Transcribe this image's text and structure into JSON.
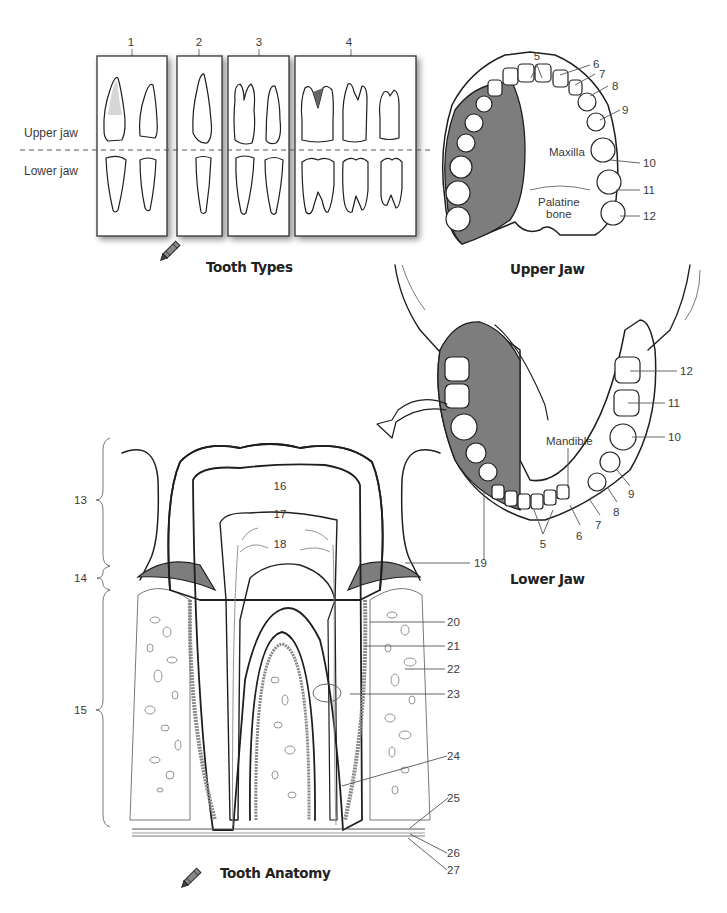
{
  "header": {
    "running_head": "Tooth Anatomy"
  },
  "tooth_types": {
    "title": "Tooth Types",
    "row_labels": {
      "upper": "Upper jaw",
      "lower": "Lower jaw"
    },
    "group_numbers": [
      "1",
      "2",
      "3",
      "4"
    ],
    "icon": "crayon-icon"
  },
  "upper_jaw": {
    "title": "Upper Jaw",
    "region_labels": {
      "maxilla": "Maxilla",
      "palatine_line1": "Palatine",
      "palatine_line2": "bone"
    },
    "callouts": [
      "5",
      "6",
      "7",
      "8",
      "9",
      "10",
      "11",
      "12"
    ]
  },
  "lower_jaw": {
    "title": "Lower Jaw",
    "region_labels": {
      "mandible": "Mandible"
    },
    "callouts": [
      "12",
      "11",
      "10",
      "9",
      "8",
      "7",
      "6",
      "5",
      "19"
    ]
  },
  "tooth_anatomy": {
    "title": "Tooth Anatomy",
    "icon": "crayon-icon",
    "bracket_labels": [
      "13",
      "14",
      "15"
    ],
    "inner_labels": [
      "16",
      "17",
      "18"
    ],
    "callouts": [
      "19",
      "20",
      "21",
      "22",
      "23",
      "24",
      "25",
      "26",
      "27"
    ]
  },
  "colors": {
    "ink": "#1e1e1e",
    "shade_gray": "#7d7d7d",
    "light_gray": "#d9d9d9",
    "label_text": "#3a3a3a"
  }
}
